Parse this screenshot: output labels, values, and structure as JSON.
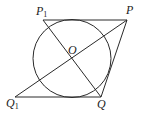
{
  "diagram": {
    "stroke_color": "#2a2a2a",
    "background": "#ffffff",
    "circle": {
      "center": "O",
      "cx": 72,
      "cy": 58.5,
      "r": 39
    },
    "points": {
      "P1": {
        "label": "P",
        "sub": "1",
        "x": 43,
        "y": 20
      },
      "P": {
        "label": "P",
        "sub": "",
        "x": 127,
        "y": 20
      },
      "Q1": {
        "label": "Q",
        "sub": "1",
        "x": 15,
        "y": 97
      },
      "Q": {
        "label": "Q",
        "sub": "",
        "x": 101,
        "y": 97
      },
      "O": {
        "label": "O",
        "sub": "",
        "x": 72,
        "y": 58.5
      }
    },
    "segments": [
      [
        "P1",
        "P"
      ],
      [
        "Q1",
        "Q"
      ],
      [
        "P",
        "Q"
      ],
      [
        "P",
        "Q1"
      ],
      [
        "P1",
        "Q"
      ]
    ]
  }
}
